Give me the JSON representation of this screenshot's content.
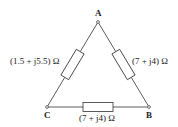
{
  "diagram": {
    "type": "delta-network",
    "nodes": {
      "A": {
        "label": "A",
        "x": 98,
        "y": 22
      },
      "B": {
        "label": "B",
        "x": 149,
        "y": 107
      },
      "C": {
        "label": "C",
        "x": 47,
        "y": 107
      }
    },
    "branches": [
      {
        "id": "AC",
        "from": "A",
        "to": "C",
        "impedance": "(1.5 + j5.5) Ω"
      },
      {
        "id": "AB",
        "from": "A",
        "to": "B",
        "impedance": "(7 + j4) Ω"
      },
      {
        "id": "CB",
        "from": "C",
        "to": "B",
        "impedance": "(7 + j4) Ω"
      }
    ],
    "colors": {
      "line": "#333333",
      "background": "#ffffff"
    }
  }
}
